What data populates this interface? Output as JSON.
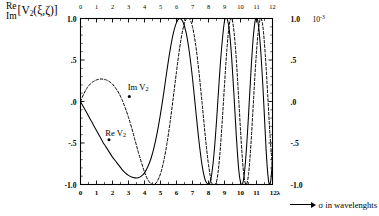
{
  "figure": {
    "y_axis_title": {
      "line1": "Re",
      "line2": "Im",
      "bracket_open": "[V",
      "sub": "2",
      "arg": "(ξ,ζ)]"
    },
    "x_axis_caption": "σ in wavelenghts",
    "right_scale": {
      "mantissa_prefix": "10",
      "exponent": "-3"
    }
  },
  "curves": {
    "real": {
      "label_prefix": "Re V",
      "label_sub": "2",
      "style": "solid",
      "color": "#000000"
    },
    "imag": {
      "label_prefix": "Im V",
      "label_sub": "2",
      "style": "dashed",
      "color": "#000000"
    }
  },
  "chart_data": {
    "type": "line",
    "title": "",
    "xlabel": "σ in wavelenghts",
    "ylabel": "Re/Im [V2(ξ,ζ)]",
    "xlim": [
      0,
      12
    ],
    "ylim": [
      -1.0,
      1.0
    ],
    "grid": false,
    "legend": "inline-annotations",
    "x_ticks": [
      0,
      1,
      2,
      3,
      4,
      5,
      6,
      7,
      8,
      9,
      10,
      11,
      12
    ],
    "x_tick_labels": [
      "0",
      "1",
      "2",
      "3",
      "4",
      "5",
      "6",
      "7",
      "8",
      "9",
      "10",
      "11",
      "12λ"
    ],
    "x_ticks_top": [
      0,
      1,
      2,
      3,
      4,
      5,
      6,
      7,
      8,
      9,
      10,
      11,
      12
    ],
    "x_tick_labels_top": [
      "0",
      "1",
      "2",
      "3",
      "4",
      "5",
      "6",
      "7",
      "8",
      "9",
      "10",
      "11",
      "12"
    ],
    "y_ticks": [
      -1.0,
      -0.5,
      0.0,
      0.5,
      1.0
    ],
    "y_tick_labels": [
      "-1.0",
      "-.5",
      ".0",
      ".5",
      "1.0"
    ],
    "y_tick_labels_right": [
      "-1.0",
      "-.5",
      ".0",
      ".5",
      "1.0"
    ],
    "y_scale_factor": "10^-3",
    "annotations": [
      {
        "text": "Im V2",
        "x": 3.6,
        "y": 0.17,
        "points_to_x": 3.05,
        "points_to_y": 0.06
      },
      {
        "text": "Re V2",
        "x": 2.2,
        "y": -0.38,
        "points_to_x": 1.78,
        "points_to_y": -0.46
      }
    ],
    "series": [
      {
        "name": "Re V2",
        "style": "solid",
        "x": [
          0.0,
          0.2,
          0.4,
          0.6,
          0.8,
          1.0,
          1.2,
          1.4,
          1.6,
          1.8,
          2.0,
          2.2,
          2.4,
          2.6,
          2.8,
          3.0,
          3.2,
          3.4,
          3.6,
          3.8,
          4.0,
          4.2,
          4.4,
          4.6,
          4.8,
          5.0,
          5.2,
          5.4,
          5.6,
          5.8,
          6.0,
          6.2,
          6.4,
          6.6,
          6.8,
          7.0,
          7.2,
          7.4,
          7.6,
          7.8,
          8.0,
          8.1,
          8.2,
          8.35,
          8.5,
          8.65,
          8.8,
          9.0,
          9.15,
          9.3,
          9.45,
          9.6,
          9.75,
          9.9,
          10.05,
          10.2,
          10.35,
          10.5,
          10.65,
          10.8,
          10.95,
          11.1,
          11.25,
          11.4,
          11.5,
          11.6,
          11.7,
          11.8,
          11.9,
          12.0
        ],
        "y": [
          0.0,
          -0.07,
          -0.14,
          -0.21,
          -0.28,
          -0.35,
          -0.42,
          -0.49,
          -0.55,
          -0.61,
          -0.67,
          -0.72,
          -0.77,
          -0.82,
          -0.86,
          -0.89,
          -0.91,
          -0.92,
          -0.92,
          -0.9,
          -0.86,
          -0.79,
          -0.69,
          -0.55,
          -0.37,
          -0.15,
          0.1,
          0.37,
          0.62,
          0.82,
          0.95,
          1.0,
          0.96,
          0.83,
          0.6,
          0.28,
          -0.1,
          -0.47,
          -0.77,
          -0.95,
          -1.0,
          -0.97,
          -0.88,
          -0.62,
          -0.24,
          0.2,
          0.6,
          0.97,
          1.0,
          0.86,
          0.52,
          0.05,
          -0.45,
          -0.84,
          -1.0,
          -0.93,
          -0.63,
          -0.17,
          0.35,
          0.78,
          1.0,
          0.95,
          0.65,
          0.18,
          -0.2,
          -0.58,
          -0.86,
          -1.0,
          -0.94,
          -0.7
        ]
      },
      {
        "name": "Im V2",
        "style": "dashed",
        "x": [
          0.0,
          0.2,
          0.4,
          0.6,
          0.8,
          1.0,
          1.2,
          1.4,
          1.6,
          1.8,
          2.0,
          2.2,
          2.4,
          2.6,
          2.8,
          3.0,
          3.2,
          3.4,
          3.6,
          3.8,
          4.0,
          4.2,
          4.4,
          4.6,
          4.8,
          5.0,
          5.2,
          5.4,
          5.6,
          5.8,
          6.0,
          6.2,
          6.4,
          6.6,
          6.8,
          7.0,
          7.2,
          7.4,
          7.6,
          7.8,
          8.0,
          8.2,
          8.4,
          8.55,
          8.7,
          8.85,
          9.0,
          9.15,
          9.3,
          9.45,
          9.6,
          9.75,
          9.9,
          10.05,
          10.2,
          10.35,
          10.5,
          10.65,
          10.8,
          10.95,
          11.1,
          11.25,
          11.4,
          11.55,
          11.7,
          11.85,
          12.0
        ],
        "y": [
          0.0,
          0.09,
          0.16,
          0.21,
          0.24,
          0.26,
          0.27,
          0.27,
          0.26,
          0.24,
          0.21,
          0.16,
          0.1,
          0.02,
          -0.08,
          -0.19,
          -0.32,
          -0.46,
          -0.6,
          -0.73,
          -0.85,
          -0.94,
          -0.99,
          -1.0,
          -0.96,
          -0.87,
          -0.72,
          -0.51,
          -0.25,
          0.05,
          0.36,
          0.65,
          0.87,
          0.99,
          1.0,
          0.9,
          0.68,
          0.36,
          -0.02,
          -0.42,
          -0.76,
          -0.98,
          -1.0,
          -0.92,
          -0.66,
          -0.26,
          0.2,
          0.63,
          0.93,
          1.0,
          0.83,
          0.47,
          -0.01,
          -0.5,
          -0.87,
          -1.0,
          -0.88,
          -0.52,
          -0.03,
          0.46,
          0.83,
          1.0,
          0.9,
          0.56,
          0.08,
          -0.42,
          -0.8
        ]
      }
    ]
  }
}
